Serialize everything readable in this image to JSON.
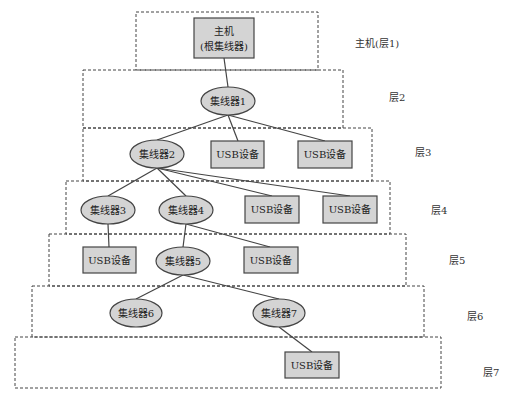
{
  "diagram": {
    "colors": {
      "node_fill": "#d4d4d4",
      "stroke": "#444444",
      "layer_border": "#444444",
      "background": "#ffffff"
    },
    "layers": [
      {
        "id": "layer1",
        "label": "主机(层1)"
      },
      {
        "id": "layer2",
        "label": "层2"
      },
      {
        "id": "layer3",
        "label": "层3"
      },
      {
        "id": "layer4",
        "label": "层4"
      },
      {
        "id": "layer5",
        "label": "层5"
      },
      {
        "id": "layer6",
        "label": "层6"
      },
      {
        "id": "layer7",
        "label": "层7"
      }
    ],
    "nodes": {
      "host": {
        "line1": "主机",
        "line2": "(根集线器)",
        "shape": "rect"
      },
      "hub1": {
        "label": "集线器1",
        "shape": "ellipse"
      },
      "hub2": {
        "label": "集线器2",
        "shape": "ellipse"
      },
      "dev3a": {
        "label": "USB设备",
        "shape": "rect"
      },
      "dev3b": {
        "label": "USB设备",
        "shape": "rect"
      },
      "hub3": {
        "label": "集线器3",
        "shape": "ellipse"
      },
      "hub4": {
        "label": "集线器4",
        "shape": "ellipse"
      },
      "dev4a": {
        "label": "USB设备",
        "shape": "rect"
      },
      "dev4b": {
        "label": "USB设备",
        "shape": "rect"
      },
      "dev5a": {
        "label": "USB设备",
        "shape": "rect"
      },
      "hub5": {
        "label": "集线器5",
        "shape": "ellipse"
      },
      "dev5b": {
        "label": "USB设备",
        "shape": "rect"
      },
      "hub6": {
        "label": "集线器6",
        "shape": "ellipse"
      },
      "hub7": {
        "label": "集线器7",
        "shape": "ellipse"
      },
      "dev7": {
        "label": "USB设备",
        "shape": "rect"
      }
    },
    "edges": [
      [
        "host",
        "hub1"
      ],
      [
        "hub1",
        "hub2"
      ],
      [
        "hub1",
        "dev3a"
      ],
      [
        "hub1",
        "dev3b"
      ],
      [
        "hub2",
        "hub3"
      ],
      [
        "hub2",
        "hub4"
      ],
      [
        "hub2",
        "dev4a"
      ],
      [
        "hub2",
        "dev4b"
      ],
      [
        "hub3",
        "dev5a"
      ],
      [
        "hub4",
        "hub5"
      ],
      [
        "hub4",
        "dev5b"
      ],
      [
        "hub5",
        "hub6"
      ],
      [
        "hub5",
        "hub7"
      ],
      [
        "hub7",
        "dev7"
      ]
    ]
  }
}
